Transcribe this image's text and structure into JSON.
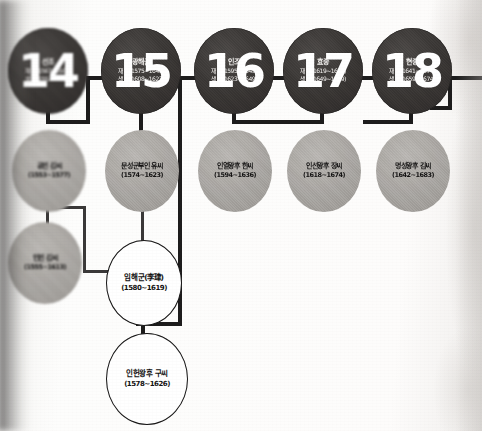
{
  "document": {
    "kind": "genealogy-chart",
    "subject": "Joseon royal family lineage, kings 14-18",
    "background_color": "#fbfafa",
    "king_node_color": "#332f2e",
    "queen_node_color": "#a9a6a2",
    "prince_node_color": "#ffffff",
    "line_color": "#1d1c1c"
  },
  "kings": [
    {
      "number": "14",
      "name": "선조",
      "reign": "재위(1567~1608)",
      "life": "생몰(1552~1608)",
      "x": 8,
      "y": 28,
      "w": 80,
      "h": 86
    },
    {
      "number": "15",
      "name": "광해군",
      "reign": "재위(1575~1641)",
      "life": "생몰(1608~1623)",
      "x": 101,
      "y": 28,
      "w": 80,
      "h": 86
    },
    {
      "number": "16",
      "name": "인조",
      "reign": "재위(1595~1649)",
      "life": "생몰(1623~1649)",
      "x": 194,
      "y": 28,
      "w": 80,
      "h": 86
    },
    {
      "number": "17",
      "name": "효종",
      "reign": "재위(1619~1659)",
      "life": "생몰(1649~1659)",
      "x": 283,
      "y": 28,
      "w": 80,
      "h": 86
    },
    {
      "number": "18",
      "name": "현종",
      "reign": "재위(1641~1674)",
      "life": "생몰(1659~1674)",
      "x": 372,
      "y": 28,
      "w": 80,
      "h": 86
    }
  ],
  "queens": [
    {
      "name": "공빈 김씨",
      "dates": "(1553~1577)",
      "x": 12,
      "y": 130,
      "w": 74,
      "h": 82
    },
    {
      "name": "문성군부인 유씨",
      "dates": "(1574~1623)",
      "x": 105,
      "y": 130,
      "w": 74,
      "h": 82
    },
    {
      "name": "인열왕후 한씨",
      "dates": "(1594~1636)",
      "x": 198,
      "y": 130,
      "w": 74,
      "h": 82
    },
    {
      "name": "인선왕후 장씨",
      "dates": "(1618~1674)",
      "x": 287,
      "y": 130,
      "w": 74,
      "h": 82
    },
    {
      "name": "명성왕후 김씨",
      "dates": "(1642~1683)",
      "x": 376,
      "y": 130,
      "w": 74,
      "h": 82
    }
  ],
  "concubines": [
    {
      "name": "인빈 김씨",
      "dates": "(1555~1613)",
      "x": 8,
      "y": 222,
      "w": 74,
      "h": 82
    }
  ],
  "princes": [
    {
      "name": "임해군(李珒)",
      "dates": "(1580~1619)",
      "x": 106,
      "y": 240,
      "w": 76,
      "h": 86
    },
    {
      "name": "인헌왕후 구씨",
      "dates": "(1578~1626)",
      "x": 106,
      "y": 333,
      "w": 82,
      "h": 92
    }
  ],
  "connectors": [
    {
      "name": "king14-to-king15-bus",
      "x": 88,
      "y": 76,
      "w": 15,
      "h": 4
    },
    {
      "name": "king15-left-drop",
      "x": 86,
      "y": 76,
      "w": 4,
      "h": 48
    },
    {
      "name": "king14-child-bus",
      "x": 48,
      "y": 120,
      "w": 42,
      "h": 4
    },
    {
      "name": "king14-child-drop",
      "x": 46,
      "y": 108,
      "w": 4,
      "h": 16
    },
    {
      "name": "king15-child-drop",
      "x": 139,
      "y": 108,
      "w": 4,
      "h": 28
    },
    {
      "name": "king16-left-bus",
      "x": 178,
      "y": 76,
      "w": 22,
      "h": 4
    },
    {
      "name": "king16-child-bus",
      "x": 232,
      "y": 120,
      "w": 42,
      "h": 4
    },
    {
      "name": "king16-child-drop",
      "x": 232,
      "y": 108,
      "w": 4,
      "h": 16
    },
    {
      "name": "king17-left-bus",
      "x": 268,
      "y": 76,
      "w": 22,
      "h": 4
    },
    {
      "name": "king17-child-drop",
      "x": 320,
      "y": 108,
      "w": 4,
      "h": 16
    },
    {
      "name": "king17-child-bus",
      "x": 274,
      "y": 120,
      "w": 50,
      "h": 4
    },
    {
      "name": "king18-left-bus",
      "x": 357,
      "y": 76,
      "w": 22,
      "h": 4
    },
    {
      "name": "king18-child-drop",
      "x": 409,
      "y": 108,
      "w": 4,
      "h": 16
    },
    {
      "name": "king18-child-bus",
      "x": 363,
      "y": 120,
      "w": 50,
      "h": 4
    },
    {
      "name": "king18-right-bus",
      "x": 448,
      "y": 76,
      "w": 34,
      "h": 4
    },
    {
      "name": "right-edge-drop",
      "x": 448,
      "y": 76,
      "w": 4,
      "h": 34
    },
    {
      "name": "right-edge-bus",
      "x": 430,
      "y": 106,
      "w": 22,
      "h": 4
    },
    {
      "name": "king16-main-trunk",
      "x": 178,
      "y": 76,
      "w": 4,
      "h": 250
    },
    {
      "name": "trunk-to-prince-bus",
      "x": 136,
      "y": 322,
      "w": 46,
      "h": 4
    },
    {
      "name": "prince-to-bottom-drop",
      "x": 141,
      "y": 318,
      "w": 4,
      "h": 18
    },
    {
      "name": "concubine-drop",
      "x": 46,
      "y": 206,
      "w": 3,
      "h": 22
    },
    {
      "name": "concubine-bus",
      "x": 46,
      "y": 206,
      "w": 40,
      "h": 3
    },
    {
      "name": "concubine-right-drop",
      "x": 83,
      "y": 206,
      "w": 3,
      "h": 66
    },
    {
      "name": "concubine-to-prince-bus",
      "x": 83,
      "y": 270,
      "w": 28,
      "h": 3
    },
    {
      "name": "queen15-to-prince-drop",
      "x": 141,
      "y": 208,
      "w": 3,
      "h": 36
    }
  ]
}
